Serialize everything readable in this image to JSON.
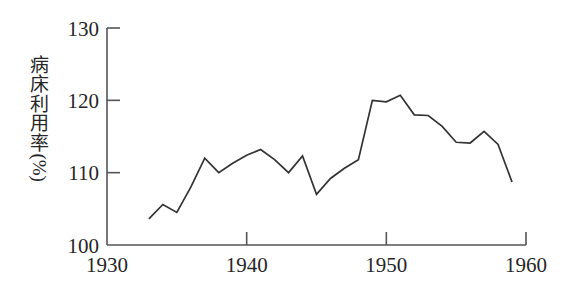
{
  "chart_data": {
    "type": "line",
    "title": "",
    "subtitle": "",
    "xlabel": "",
    "ylabel": "病床利用率",
    "ylabel_chars": [
      "病",
      "床",
      "利",
      "用",
      "率"
    ],
    "yunit": "(%)",
    "xlim": [
      1930,
      1960
    ],
    "ylim": [
      100,
      130
    ],
    "xticks": [
      1930,
      1940,
      1950,
      1960
    ],
    "xticklabels": [
      "1930",
      "1940",
      "1950",
      "1960"
    ],
    "yticks": [
      100,
      110,
      120,
      130
    ],
    "yticklabels": [
      "100",
      "110",
      "120",
      "130"
    ],
    "grid": false,
    "legend": null,
    "line_color": "#333333",
    "axis_color": "#555555",
    "x": [
      1933,
      1934,
      1935,
      1936,
      1937,
      1938,
      1939,
      1940,
      1941,
      1942,
      1943,
      1944,
      1945,
      1946,
      1947,
      1948,
      1949,
      1950,
      1951,
      1952,
      1953,
      1954,
      1955,
      1956,
      1957,
      1958,
      1959
    ],
    "values": [
      103.6,
      105.6,
      104.5,
      108.0,
      112.0,
      110.0,
      111.3,
      112.4,
      113.2,
      111.8,
      110.0,
      112.3,
      107.0,
      109.2,
      110.6,
      111.8,
      120.0,
      119.8,
      120.7,
      118.0,
      117.9,
      116.4,
      114.2,
      114.1,
      115.7,
      113.9,
      108.7
    ],
    "series": [
      {
        "name": "病床利用率",
        "values": [
          103.6,
          105.6,
          104.5,
          108.0,
          112.0,
          110.0,
          111.3,
          112.4,
          113.2,
          111.8,
          110.0,
          112.3,
          107.0,
          109.2,
          110.6,
          111.8,
          120.0,
          119.8,
          120.7,
          118.0,
          117.9,
          116.4,
          114.2,
          114.1,
          115.7,
          113.9,
          108.7
        ]
      }
    ]
  }
}
